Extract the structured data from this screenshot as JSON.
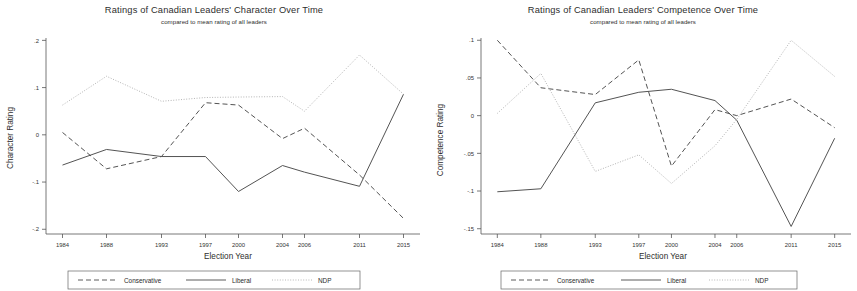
{
  "figure": {
    "subtitle": "compared to mean rating of all leaders",
    "xlabel": "Election Year",
    "legend": {
      "conservative": "Conservative",
      "liberal": "Liberal",
      "ndp": "NDP"
    },
    "colors": {
      "conservative": "#4a4a4a",
      "liberal": "#4a4a4a",
      "ndp": "#b0b0b0",
      "axis": "#555555",
      "text": "#2e2e2e"
    }
  },
  "chart_data": [
    {
      "type": "line",
      "id": "character",
      "title": "Ratings of Canadian Leaders' Character Over Time",
      "subtitle": "compared to mean rating of all leaders",
      "xlabel": "Election Year",
      "ylabel": "Character Rating",
      "x": [
        1984,
        1988,
        1993,
        1997,
        2000,
        2004,
        2006,
        2011,
        2015
      ],
      "categories": [
        "1984",
        "1988",
        "1993",
        "1997",
        "2000",
        "2004",
        "2006",
        "2011",
        "2015"
      ],
      "xticklabels": [
        "1984",
        "1988",
        "1993",
        "1997",
        "2000",
        "2004",
        "2006",
        "2011",
        "2015"
      ],
      "yticks": [
        0.2,
        0.1,
        0,
        -0.1,
        -0.2
      ],
      "yticklabels": [
        ".2",
        ".1",
        "0",
        "-.1",
        "-.2"
      ],
      "ylim": [
        -0.21,
        0.205
      ],
      "xlim": [
        1982.5,
        2016.5
      ],
      "grid": false,
      "legend_position": "below",
      "series": [
        {
          "name": "Conservative",
          "style": "dashed",
          "color": "#4a4a4a",
          "values": [
            0.005,
            -0.072,
            -0.046,
            0.068,
            0.063,
            -0.008,
            0.014,
            -0.085,
            -0.177
          ]
        },
        {
          "name": "Liberal",
          "style": "solid",
          "color": "#4a4a4a",
          "values": [
            -0.064,
            -0.031,
            -0.046,
            -0.046,
            -0.12,
            -0.065,
            -0.079,
            -0.109,
            0.086
          ]
        },
        {
          "name": "NDP",
          "style": "dotted",
          "color": "#b0b0b0",
          "values": [
            0.063,
            0.124,
            0.071,
            0.079,
            0.08,
            0.081,
            0.05,
            0.169,
            0.086
          ]
        }
      ]
    },
    {
      "type": "line",
      "id": "competence",
      "title": "Ratings of Canadian Leaders' Competence Over Time",
      "subtitle": "compared to mean rating of all leaders",
      "xlabel": "Election Year",
      "ylabel": "Competence Rating",
      "x": [
        1984,
        1988,
        1993,
        1997,
        2000,
        2004,
        2006,
        2011,
        2015
      ],
      "categories": [
        "1984",
        "1988",
        "1993",
        "1997",
        "2000",
        "2004",
        "2006",
        "2011",
        "2015"
      ],
      "xticklabels": [
        "1984",
        "1988",
        "1993",
        "1997",
        "2000",
        "2004",
        "2006",
        "2011",
        "2015"
      ],
      "yticks": [
        0.1,
        0.05,
        0,
        -0.05,
        -0.1,
        -0.15
      ],
      "yticklabels": [
        ".1",
        ".05",
        "0",
        "-.05",
        "-.1",
        "-.15"
      ],
      "ylim": [
        -0.157,
        0.103
      ],
      "xlim": [
        1982.5,
        2016.5
      ],
      "grid": false,
      "legend_position": "below",
      "series": [
        {
          "name": "Conservative",
          "style": "dashed",
          "color": "#4a4a4a",
          "values": [
            0.1,
            0.037,
            0.028,
            0.074,
            -0.067,
            0.008,
            0.0,
            0.022,
            -0.016
          ]
        },
        {
          "name": "Liberal",
          "style": "solid",
          "color": "#4a4a4a",
          "values": [
            -0.101,
            -0.097,
            0.017,
            0.031,
            0.035,
            0.02,
            -0.006,
            -0.147,
            -0.03
          ]
        },
        {
          "name": "NDP",
          "style": "dotted",
          "color": "#b0b0b0",
          "values": [
            0.003,
            0.056,
            -0.074,
            -0.052,
            -0.09,
            -0.04,
            -0.005,
            0.1,
            0.052
          ]
        }
      ]
    }
  ]
}
